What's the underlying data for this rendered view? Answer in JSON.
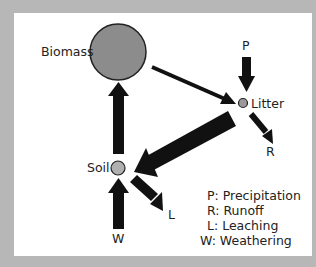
{
  "diagram": {
    "nodes": [
      {
        "id": "biomass",
        "label": "Biomass",
        "fill": "#8c8c8c"
      },
      {
        "id": "litter",
        "label": "Litter",
        "fill": "#9a9a9a"
      },
      {
        "id": "soil",
        "label": "Soil",
        "fill": "#b0b0b0"
      }
    ],
    "flows": [
      {
        "id": "P",
        "label": "P",
        "to": "litter"
      },
      {
        "id": "R",
        "label": "R",
        "from": "litter"
      },
      {
        "id": "L",
        "label": "L",
        "from": "soil"
      },
      {
        "id": "W",
        "label": "W",
        "to": "soil"
      },
      {
        "id": "biomass-litter",
        "from": "biomass",
        "to": "litter"
      },
      {
        "id": "litter-soil",
        "from": "litter",
        "to": "soil"
      },
      {
        "id": "soil-biomass",
        "from": "soil",
        "to": "biomass"
      }
    ],
    "legend": [
      "P: Precipitation",
      "R: Runoff",
      "L: Leaching",
      "W: Weathering"
    ],
    "colors": {
      "frame": "#b7b7b7",
      "arrow": "#111111",
      "background": "#ffffff"
    }
  }
}
